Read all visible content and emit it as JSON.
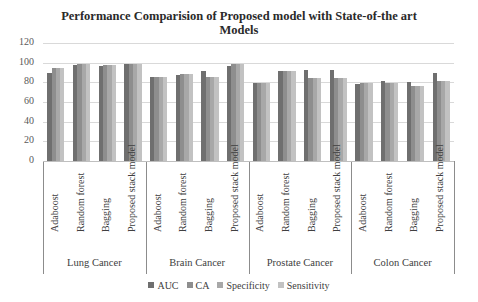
{
  "chart_data": {
    "type": "bar",
    "title": "Performance Comparision of Proposed model with State-of-the art Models",
    "title_lines": [
      "Performance Comparision of Proposed model with State-of-the art",
      "Models"
    ],
    "xlabel": "",
    "ylabel": "",
    "ylim": [
      0,
      120
    ],
    "yticks": [
      0,
      20,
      40,
      60,
      80,
      100,
      120
    ],
    "grid": true,
    "legend_position": "bottom",
    "groups": [
      {
        "name": "Lung Cancer",
        "categories": [
          "Adaboost",
          "Random forest",
          "Bagging",
          "Proposed stack model"
        ]
      },
      {
        "name": "Brain Cancer",
        "categories": [
          "Adaboost",
          "Random forest",
          "Bagging",
          "Proposed stack model"
        ]
      },
      {
        "name": "Prostate Cancer",
        "categories": [
          "Adaboost",
          "Random forest",
          "Bagging",
          "Proposed stack model"
        ]
      },
      {
        "name": "Colon Cancer",
        "categories": [
          "Adaboost",
          "Random forest",
          "Bagging",
          "Proposed stack model"
        ]
      }
    ],
    "categories": [
      "Adaboost",
      "Random forest",
      "Bagging",
      "Proposed stack model",
      "Adaboost",
      "Random forest",
      "Bagging",
      "Proposed stack model",
      "Adaboost",
      "Random forest",
      "Bagging",
      "Proposed stack model",
      "Adaboost",
      "Random forest",
      "Bagging",
      "Proposed stack model"
    ],
    "series": [
      {
        "name": "AUC",
        "color": "#6f6f6f",
        "values": [
          90,
          97.5,
          97,
          99,
          85,
          87,
          91.5,
          96.5,
          79,
          91.5,
          92.5,
          93,
          78,
          81.5,
          80.5,
          89
        ]
      },
      {
        "name": "CA",
        "color": "#8e8e8e",
        "values": [
          95,
          99,
          98,
          99,
          85,
          88.5,
          85,
          99,
          79,
          91.5,
          84.5,
          84.5,
          79.5,
          79,
          76,
          81.5
        ]
      },
      {
        "name": "Specificity",
        "color": "#a8a8a8",
        "values": [
          95,
          99,
          98,
          99,
          85,
          88.5,
          85,
          99,
          79,
          91.5,
          84.5,
          84.5,
          79.5,
          79,
          76,
          81.5
        ]
      },
      {
        "name": "Sensitivity",
        "color": "#c2c2c2",
        "values": [
          95,
          99,
          98,
          99,
          85,
          88.5,
          85,
          99,
          79,
          91.5,
          84.5,
          84.5,
          79.5,
          79,
          76,
          81.5
        ]
      }
    ]
  }
}
